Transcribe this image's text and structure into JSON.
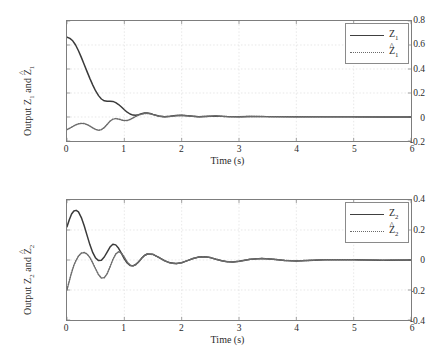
{
  "figure": {
    "background": "#ffffff",
    "axis_color": "#7d7d7d",
    "grid_color": "#d8d8d8",
    "series_colors": {
      "actual": "#3a3a3a",
      "estimate": "#6a6a6a"
    }
  },
  "panels": [
    {
      "id": "top",
      "ylabel_prefix": "Output ",
      "ylabel_var1": "Z",
      "ylabel_sub1": "1",
      "ylabel_mid": " and ",
      "ylabel_var2": "Z",
      "ylabel_sub2": "1",
      "xlabel": "Time (s)",
      "yticks": [
        "0.8",
        "0.6",
        "0.4",
        "0.2",
        "0",
        "-0.2"
      ],
      "xticks": [
        "0",
        "1",
        "2",
        "3",
        "4",
        "5",
        "6"
      ],
      "legend": [
        {
          "var": "Z",
          "sub": "1",
          "hat": false,
          "style": "solid"
        },
        {
          "var": "Z",
          "sub": "1",
          "hat": true,
          "style": "dotted"
        }
      ]
    },
    {
      "id": "bottom",
      "ylabel_prefix": "Output ",
      "ylabel_var1": "Z",
      "ylabel_sub1": "2",
      "ylabel_mid": " and ",
      "ylabel_var2": "Z",
      "ylabel_sub2": "2",
      "xlabel": "Time (s)",
      "yticks": [
        "0.4",
        "0.2",
        "0",
        "-0.2",
        "-0.4"
      ],
      "xticks": [
        "0",
        "1",
        "2",
        "3",
        "4",
        "5",
        "6"
      ],
      "legend": [
        {
          "var": "Z",
          "sub": "2",
          "hat": false,
          "style": "solid"
        },
        {
          "var": "Z",
          "sub": "2",
          "hat": true,
          "style": "dotted"
        }
      ]
    }
  ],
  "chart_data": [
    {
      "type": "line",
      "title": "",
      "xlabel": "Time (s)",
      "ylabel": "Output Z1 and Z1-hat",
      "xlim": [
        0,
        6
      ],
      "ylim": [
        -0.2,
        0.8
      ],
      "xticks": [
        0,
        1,
        2,
        3,
        4,
        5,
        6
      ],
      "yticks": [
        -0.2,
        0,
        0.2,
        0.4,
        0.6,
        0.8
      ],
      "grid": true,
      "legend_position": "top-right",
      "series": [
        {
          "name": "Z1",
          "style": "solid",
          "color": "#3a3a3a",
          "x": [
            0,
            0.05,
            0.1,
            0.15,
            0.2,
            0.25,
            0.3,
            0.35,
            0.4,
            0.45,
            0.5,
            0.55,
            0.6,
            0.65,
            0.7,
            0.75,
            0.8,
            0.85,
            0.9,
            0.95,
            1.0,
            1.05,
            1.1,
            1.15,
            1.2,
            1.25,
            1.3,
            1.35,
            1.4,
            1.45,
            1.5,
            1.6,
            1.7,
            1.8,
            1.9,
            2.0,
            2.1,
            2.2,
            2.3,
            2.4,
            2.5,
            2.6,
            2.8,
            3.0,
            3.2,
            3.5,
            4.0,
            4.5,
            5.0,
            5.5,
            6.0
          ],
          "y": [
            0.665,
            0.655,
            0.635,
            0.6,
            0.552,
            0.497,
            0.438,
            0.378,
            0.32,
            0.266,
            0.217,
            0.178,
            0.15,
            0.135,
            0.131,
            0.132,
            0.13,
            0.12,
            0.104,
            0.083,
            0.06,
            0.04,
            0.025,
            0.016,
            0.015,
            0.02,
            0.028,
            0.033,
            0.034,
            0.03,
            0.022,
            0.008,
            0.002,
            0.006,
            0.012,
            0.014,
            0.011,
            0.006,
            0.002,
            0.004,
            0.007,
            0.008,
            0.003,
            0.002,
            0.004,
            0.003,
            0.002,
            0.001,
            0.001,
            0.0,
            0.0
          ]
        },
        {
          "name": "Z1-hat",
          "style": "dotted",
          "color": "#6a6a6a",
          "x": [
            0,
            0.05,
            0.1,
            0.15,
            0.2,
            0.25,
            0.3,
            0.35,
            0.4,
            0.45,
            0.5,
            0.55,
            0.6,
            0.65,
            0.7,
            0.75,
            0.8,
            0.85,
            0.9,
            0.95,
            1.0,
            1.05,
            1.1,
            1.15,
            1.2,
            1.25,
            1.3,
            1.35,
            1.4,
            1.45,
            1.5,
            1.6,
            1.7,
            1.8,
            1.9,
            2.0,
            2.1,
            2.2,
            2.3,
            2.4,
            2.5,
            2.6,
            2.8,
            3.0,
            3.2,
            3.5,
            4.0,
            4.5,
            5.0,
            5.5,
            6.0
          ],
          "y": [
            -0.105,
            -0.093,
            -0.079,
            -0.066,
            -0.057,
            -0.053,
            -0.055,
            -0.063,
            -0.076,
            -0.091,
            -0.104,
            -0.11,
            -0.105,
            -0.088,
            -0.062,
            -0.035,
            -0.018,
            -0.013,
            -0.017,
            -0.024,
            -0.03,
            -0.029,
            -0.021,
            -0.008,
            0.005,
            0.016,
            0.024,
            0.029,
            0.03,
            0.027,
            0.02,
            0.007,
            0.001,
            0.005,
            0.011,
            0.013,
            0.01,
            0.005,
            0.002,
            0.004,
            0.007,
            0.008,
            0.003,
            0.002,
            0.004,
            0.003,
            0.002,
            0.001,
            0.001,
            0.0,
            0.0
          ]
        }
      ]
    },
    {
      "type": "line",
      "title": "",
      "xlabel": "Time (s)",
      "ylabel": "Output Z2 and Z2-hat",
      "xlim": [
        0,
        6
      ],
      "ylim": [
        -0.4,
        0.4
      ],
      "xticks": [
        0,
        1,
        2,
        3,
        4,
        5,
        6
      ],
      "yticks": [
        -0.4,
        -0.2,
        0,
        0.2,
        0.4
      ],
      "grid": true,
      "legend_position": "top-right",
      "series": [
        {
          "name": "Z2",
          "style": "solid",
          "color": "#3a3a3a",
          "x": [
            0,
            0.04,
            0.08,
            0.12,
            0.16,
            0.2,
            0.25,
            0.3,
            0.35,
            0.4,
            0.45,
            0.5,
            0.55,
            0.6,
            0.65,
            0.7,
            0.75,
            0.8,
            0.85,
            0.9,
            0.95,
            1.0,
            1.05,
            1.1,
            1.15,
            1.2,
            1.25,
            1.3,
            1.35,
            1.4,
            1.5,
            1.6,
            1.7,
            1.8,
            1.9,
            2.0,
            2.1,
            2.2,
            2.3,
            2.4,
            2.5,
            2.6,
            2.7,
            2.8,
            2.9,
            3.0,
            3.2,
            3.4,
            3.6,
            3.8,
            4.0,
            4.5,
            5.0,
            5.5,
            6.0
          ],
          "y": [
            0.222,
            0.268,
            0.307,
            0.327,
            0.331,
            0.321,
            0.283,
            0.228,
            0.164,
            0.101,
            0.049,
            0.013,
            -0.004,
            -0.001,
            0.02,
            0.053,
            0.086,
            0.105,
            0.101,
            0.078,
            0.044,
            0.008,
            -0.02,
            -0.036,
            -0.039,
            -0.03,
            -0.012,
            0.011,
            0.03,
            0.04,
            0.038,
            0.018,
            -0.004,
            -0.019,
            -0.024,
            -0.018,
            -0.004,
            0.01,
            0.02,
            0.022,
            0.016,
            0.005,
            -0.005,
            -0.012,
            -0.013,
            -0.009,
            0.005,
            0.01,
            0.005,
            -0.003,
            -0.006,
            0.002,
            0.001,
            -0.001,
            0.0
          ]
        },
        {
          "name": "Z2-hat",
          "style": "dotted",
          "color": "#6a6a6a",
          "x": [
            0,
            0.04,
            0.08,
            0.12,
            0.16,
            0.2,
            0.25,
            0.3,
            0.35,
            0.4,
            0.45,
            0.5,
            0.55,
            0.6,
            0.65,
            0.7,
            0.75,
            0.8,
            0.85,
            0.9,
            0.95,
            1.0,
            1.05,
            1.1,
            1.15,
            1.2,
            1.25,
            1.3,
            1.35,
            1.4,
            1.5,
            1.6,
            1.7,
            1.8,
            1.9,
            2.0,
            2.1,
            2.2,
            2.3,
            2.4,
            2.5,
            2.6,
            2.7,
            2.8,
            2.9,
            3.0,
            3.2,
            3.4,
            3.6,
            3.8,
            4.0,
            4.5,
            5.0,
            5.5,
            6.0
          ],
          "y": [
            -0.198,
            -0.14,
            -0.083,
            -0.035,
            -0.001,
            0.026,
            0.046,
            0.05,
            0.04,
            0.016,
            -0.02,
            -0.06,
            -0.098,
            -0.12,
            -0.118,
            -0.092,
            -0.046,
            0.003,
            0.04,
            0.055,
            0.046,
            0.018,
            -0.014,
            -0.034,
            -0.04,
            -0.031,
            -0.013,
            0.01,
            0.029,
            0.039,
            0.037,
            0.017,
            -0.005,
            -0.02,
            -0.025,
            -0.018,
            -0.004,
            0.01,
            0.02,
            0.022,
            0.016,
            0.005,
            -0.005,
            -0.012,
            -0.013,
            -0.009,
            0.005,
            0.01,
            0.005,
            -0.003,
            -0.006,
            0.002,
            0.001,
            -0.001,
            0.0
          ]
        }
      ]
    }
  ]
}
